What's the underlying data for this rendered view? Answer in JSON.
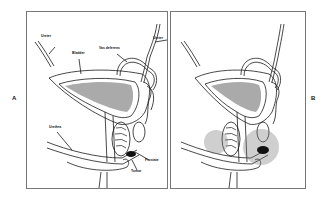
{
  "figure": {
    "panels": [
      {
        "id": "A",
        "letter": "A",
        "labels": {
          "ureter_left": "Ureter",
          "ureter_right": "Ureter",
          "vas_deferens": "Vas deferens",
          "bladder": "Bladder",
          "urethra": "Urethra",
          "prostate": "Prostate",
          "tumor": "Tumor"
        }
      },
      {
        "id": "B",
        "letter": "B",
        "labels": {}
      }
    ],
    "colors": {
      "line": "#1a1a1a",
      "frame": "#777777",
      "stipple": "#555555",
      "tumor": "#111111"
    }
  }
}
